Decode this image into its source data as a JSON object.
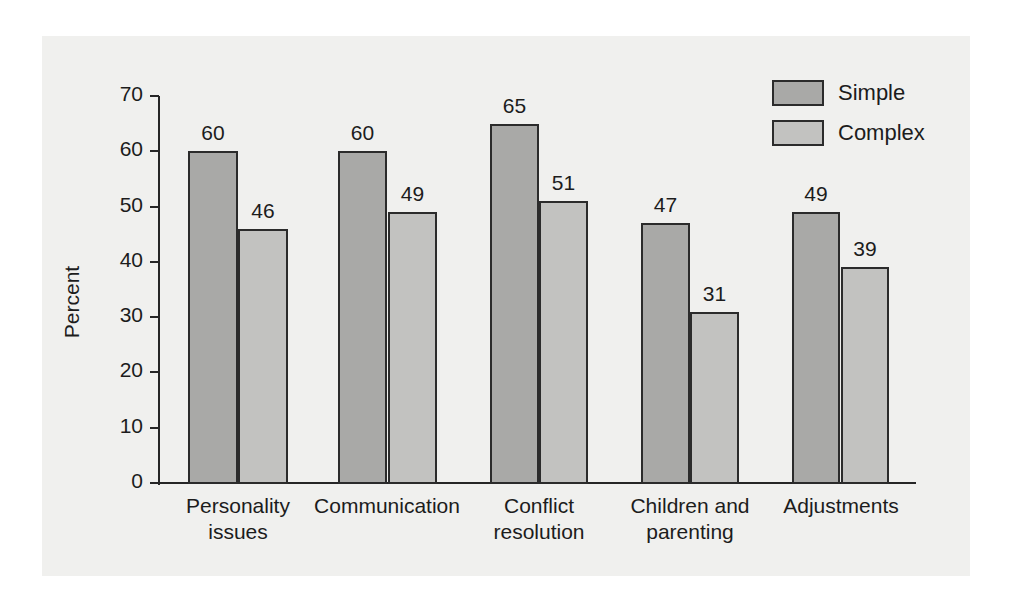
{
  "chart_data": {
    "type": "bar",
    "title": "",
    "xlabel": "",
    "ylabel": "Percent",
    "ylim": [
      0,
      70
    ],
    "ytick_step": 10,
    "yticks": [
      0,
      10,
      20,
      30,
      40,
      50,
      60,
      70
    ],
    "ytick_labels": [
      "0",
      "10",
      "20",
      "30",
      "40",
      "50",
      "60",
      "70"
    ],
    "grid": false,
    "legend_position": "top-right",
    "categories": [
      "Personality issues",
      "Communication",
      "Conflict resolution",
      "Children and parenting",
      "Adjustments"
    ],
    "category_lines": [
      [
        "Personality",
        "issues"
      ],
      [
        "Communication",
        ""
      ],
      [
        "Conflict",
        "resolution"
      ],
      [
        "Children and",
        "parenting"
      ],
      [
        "Adjustments",
        ""
      ]
    ],
    "series": [
      {
        "name": "Simple",
        "color": "#a9a9a7",
        "values": [
          60,
          60,
          65,
          47,
          49
        ],
        "labels": [
          "60",
          "60",
          "65",
          "47",
          "49"
        ]
      },
      {
        "name": "Complex",
        "color": "#c2c2c0",
        "values": [
          46,
          49,
          51,
          31,
          39
        ],
        "labels": [
          "46",
          "49",
          "51",
          "31",
          "39"
        ]
      }
    ]
  },
  "legend": {
    "items": [
      {
        "label": "Simple",
        "color": "#a9a9a7"
      },
      {
        "label": "Complex",
        "color": "#c2c2c0"
      }
    ]
  },
  "axis": {
    "y_title": "Percent"
  },
  "colors": {
    "panel_background": "#f0f0ee",
    "page_background": "#ffffff",
    "axis": "#262626",
    "bar_outline": "#2b2b2b",
    "text": "#1c1c1c",
    "simple": "#a9a9a7",
    "complex": "#c2c2c0"
  }
}
